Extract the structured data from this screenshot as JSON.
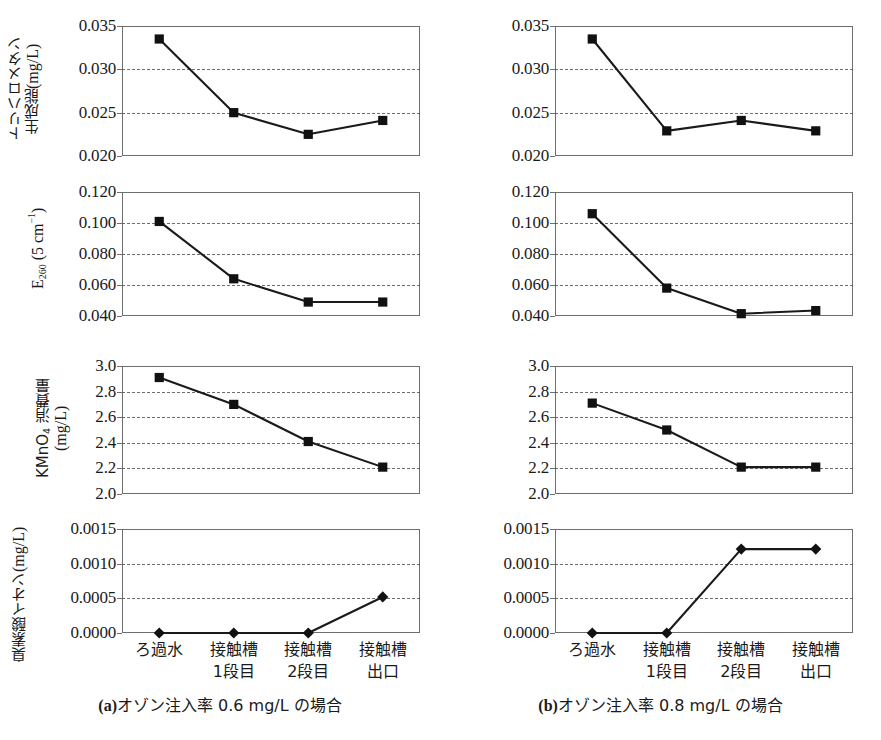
{
  "figure": {
    "x_categories": [
      "ろ過水",
      "接触槽\n1段目",
      "接触槽\n2段目",
      "接触槽\n出口"
    ],
    "panels": [
      {
        "id": "a",
        "caption_tag": "(a)",
        "caption_text": "オゾン注入率 0.6 mg/L の場合"
      },
      {
        "id": "b",
        "caption_tag": "(b)",
        "caption_text": "オゾン注入率 0.8 mg/L の場合"
      }
    ]
  },
  "axis_titles": {
    "thm": "トリハロメタン\n生成能 (mg/L)",
    "e260": "E260 (5 cm-1)",
    "kmno4": "KMnO4 消費量\n(mg/L)",
    "bromate": "臭素酸イオン (mg/L)"
  },
  "chart_data": [
    {
      "id": "thm-a",
      "panel": "a",
      "type": "line",
      "title": "",
      "xlabel": "",
      "ylabel": "トリハロメタン生成能 (mg/L)",
      "categories": [
        "ろ過水",
        "接触槽1段目",
        "接触槽2段目",
        "接触槽出口"
      ],
      "values": [
        0.0335,
        0.025,
        0.0225,
        0.0241
      ],
      "ylim": [
        0.02,
        0.035
      ],
      "yticks": [
        0.02,
        0.025,
        0.03,
        0.035
      ],
      "ytick_labels": [
        "0.020",
        "0.025",
        "0.030",
        "0.035"
      ],
      "gridlines": [
        0.025,
        0.03
      ],
      "grid": true,
      "marker": "square",
      "legend": "none"
    },
    {
      "id": "thm-b",
      "panel": "b",
      "type": "line",
      "title": "",
      "xlabel": "",
      "ylabel": "トリハロメタン生成能 (mg/L)",
      "categories": [
        "ろ過水",
        "接触槽1段目",
        "接触槽2段目",
        "接触槽出口"
      ],
      "values": [
        0.0335,
        0.0229,
        0.0241,
        0.0229
      ],
      "ylim": [
        0.02,
        0.035
      ],
      "yticks": [
        0.02,
        0.025,
        0.03,
        0.035
      ],
      "ytick_labels": [
        "0.020",
        "0.025",
        "0.030",
        "0.035"
      ],
      "gridlines": [
        0.025,
        0.03
      ],
      "grid": true,
      "marker": "square",
      "legend": "none"
    },
    {
      "id": "e260-a",
      "panel": "a",
      "type": "line",
      "title": "",
      "xlabel": "",
      "ylabel": "E260 (5 cm-1)",
      "categories": [
        "ろ過水",
        "接触槽1段目",
        "接触槽2段目",
        "接触槽出口"
      ],
      "values": [
        0.101,
        0.064,
        0.049,
        0.049
      ],
      "ylim": [
        0.04,
        0.12
      ],
      "yticks": [
        0.04,
        0.06,
        0.08,
        0.1,
        0.12
      ],
      "ytick_labels": [
        "0.040",
        "0.060",
        "0.080",
        "0.100",
        "0.120"
      ],
      "gridlines": [
        0.06,
        0.08,
        0.1
      ],
      "grid": true,
      "marker": "square",
      "legend": "none"
    },
    {
      "id": "e260-b",
      "panel": "b",
      "type": "line",
      "title": "",
      "xlabel": "",
      "ylabel": "E260 (5 cm-1)",
      "categories": [
        "ろ過水",
        "接触槽1段目",
        "接触槽2段目",
        "接触槽出口"
      ],
      "values": [
        0.106,
        0.058,
        0.0415,
        0.0435
      ],
      "ylim": [
        0.04,
        0.12
      ],
      "yticks": [
        0.04,
        0.06,
        0.08,
        0.1,
        0.12
      ],
      "ytick_labels": [
        "0.040",
        "0.060",
        "0.080",
        "0.100",
        "0.120"
      ],
      "gridlines": [
        0.06,
        0.08,
        0.1
      ],
      "grid": true,
      "marker": "square",
      "legend": "none"
    },
    {
      "id": "kmno4-a",
      "panel": "a",
      "type": "line",
      "title": "",
      "xlabel": "",
      "ylabel": "KMnO4 消費量 (mg/L)",
      "categories": [
        "ろ過水",
        "接触槽1段目",
        "接触槽2段目",
        "接触槽出口"
      ],
      "values": [
        2.91,
        2.7,
        2.41,
        2.21
      ],
      "ylim": [
        2.0,
        3.0
      ],
      "yticks": [
        2.0,
        2.2,
        2.4,
        2.6,
        2.8,
        3.0
      ],
      "ytick_labels": [
        "2.0",
        "2.2",
        "2.4",
        "2.6",
        "2.8",
        "3.0"
      ],
      "gridlines": [
        2.2,
        2.4,
        2.6,
        2.8
      ],
      "grid": true,
      "marker": "square",
      "legend": "none"
    },
    {
      "id": "kmno4-b",
      "panel": "b",
      "type": "line",
      "title": "",
      "xlabel": "",
      "ylabel": "KMnO4 消費量 (mg/L)",
      "categories": [
        "ろ過水",
        "接触槽1段目",
        "接触槽2段目",
        "接触槽出口"
      ],
      "values": [
        2.71,
        2.5,
        2.21,
        2.21
      ],
      "ylim": [
        2.0,
        3.0
      ],
      "yticks": [
        2.0,
        2.2,
        2.4,
        2.6,
        2.8,
        3.0
      ],
      "ytick_labels": [
        "2.0",
        "2.2",
        "2.4",
        "2.6",
        "2.8",
        "3.0"
      ],
      "gridlines": [
        2.2,
        2.4,
        2.6,
        2.8
      ],
      "grid": true,
      "marker": "square",
      "legend": "none"
    },
    {
      "id": "bromate-a",
      "panel": "a",
      "type": "line",
      "title": "",
      "xlabel": "",
      "ylabel": "臭素酸イオン (mg/L)",
      "categories": [
        "ろ過水",
        "接触槽1段目",
        "接触槽2段目",
        "接触槽出口"
      ],
      "values": [
        0.0,
        0.0,
        0.0,
        0.00052
      ],
      "ylim": [
        0.0,
        0.0015
      ],
      "yticks": [
        0.0,
        0.0005,
        0.001,
        0.0015
      ],
      "ytick_labels": [
        "0.0000",
        "0.0005",
        "0.0010",
        "0.0015"
      ],
      "gridlines": [
        0.0005,
        0.001
      ],
      "grid": true,
      "marker": "diamond",
      "legend": "none"
    },
    {
      "id": "bromate-b",
      "panel": "b",
      "type": "line",
      "title": "",
      "xlabel": "",
      "ylabel": "臭素酸イオン (mg/L)",
      "categories": [
        "ろ過水",
        "接触槽1段目",
        "接触槽2段目",
        "接触槽出口"
      ],
      "values": [
        0.0,
        0.0,
        0.00121,
        0.00121
      ],
      "ylim": [
        0.0,
        0.0015
      ],
      "yticks": [
        0.0,
        0.0005,
        0.001,
        0.0015
      ],
      "ytick_labels": [
        "0.0000",
        "0.0005",
        "0.0010",
        "0.0015"
      ],
      "gridlines": [
        0.0005,
        0.001
      ],
      "grid": true,
      "marker": "diamond",
      "legend": "none"
    }
  ],
  "colors": {
    "line": "#1a1a1a",
    "marker": "#111111",
    "axis": "#6e6e6e",
    "grid": "#555555",
    "background": "#ffffff"
  }
}
